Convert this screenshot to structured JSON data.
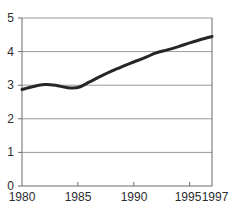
{
  "chart_data": {
    "type": "line",
    "title": "",
    "subtitle": "",
    "xlabel": "",
    "ylabel": "",
    "xlim": [
      1980,
      1997
    ],
    "ylim": [
      0,
      5
    ],
    "grid": true,
    "legend": null,
    "legend_position": "none",
    "x_tick_labels": [
      "1980",
      "1985",
      "1990",
      "1995",
      "1997"
    ],
    "x_ticks": [
      1980,
      1985,
      1990,
      1995,
      1997
    ],
    "y_tick_labels": [
      "0",
      "1",
      "2",
      "3",
      "4",
      "5"
    ],
    "y_ticks": [
      0,
      1,
      2,
      3,
      4,
      5
    ],
    "series": [
      {
        "name": "",
        "color": "#262626",
        "line_width": 3,
        "x": [
          1980,
          1981,
          1982,
          1983,
          1984,
          1985,
          1986,
          1987,
          1988,
          1989,
          1990,
          1991,
          1992,
          1993,
          1994,
          1995,
          1996,
          1997
        ],
        "values": [
          2.87,
          2.96,
          3.02,
          3.0,
          2.93,
          2.93,
          3.09,
          3.26,
          3.42,
          3.56,
          3.69,
          3.82,
          3.96,
          4.05,
          4.15,
          4.26,
          4.36,
          4.45
        ]
      }
    ]
  },
  "axes": {
    "frame_color": "#6b6b6b",
    "grid_color": "#9a9a9a",
    "tick_color": "#6b6b6b",
    "label_color": "#2b2b2b"
  }
}
